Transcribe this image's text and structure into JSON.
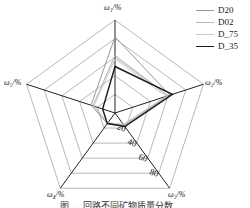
{
  "chart_data": {
    "type": "radar",
    "title": "",
    "axes": [
      "ω1/%",
      "ω2/%",
      "ω3/%",
      "ω4/%",
      "ω5/%"
    ],
    "ring_ticks": [
      "20",
      "40",
      "60",
      "80"
    ],
    "range": [
      0,
      100
    ],
    "series": [
      {
        "name": "D20",
        "color": "#9a9a9a",
        "width": 1.0,
        "values": [
          82,
          62,
          17,
          14,
          27
        ]
      },
      {
        "name": "D02",
        "color": "#b5b5b5",
        "width": 1.0,
        "values": [
          62,
          60,
          16,
          13,
          25
        ]
      },
      {
        "name": "D_75",
        "color": "#c8c8c8",
        "width": 1.0,
        "values": [
          58,
          58,
          15,
          13,
          24
        ]
      },
      {
        "name": "D_35",
        "color": "#1a1a1a",
        "width": 1.4,
        "values": [
          50,
          65,
          18,
          14,
          14
        ]
      }
    ],
    "legend_position": "top-right",
    "grid": true
  },
  "labels": {
    "axis_top": "ω₁/%",
    "axis_right": "ω₂/%",
    "axis_bottom_right": "ω₃/%",
    "axis_bottom_left": "ω₄/%",
    "axis_left": "ω₅/%"
  },
  "legend": [
    "D20",
    "D02",
    "D_75",
    "D_35"
  ],
  "caption": "图 ... 回路不同矿物质量分数"
}
